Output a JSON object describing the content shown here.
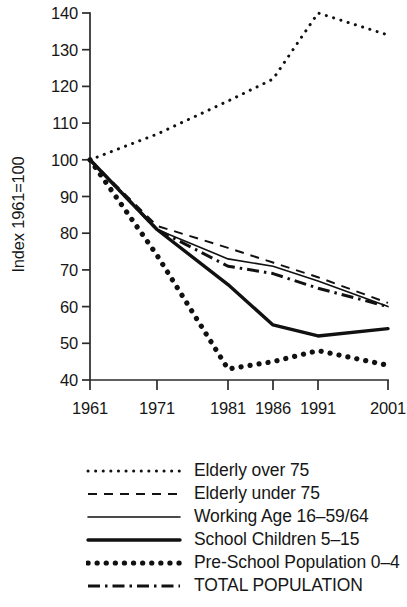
{
  "chart_data": {
    "type": "line",
    "title": "",
    "xlabel": "",
    "ylabel": "Index 1961=100",
    "x": [
      1961,
      1971,
      1981,
      1986,
      1991,
      2001
    ],
    "xtick_labels": [
      "1961",
      "1971",
      "1981",
      "1986",
      "1991",
      "2001"
    ],
    "ytick_labels": [
      "40",
      "50",
      "60",
      "70",
      "80",
      "90",
      "100",
      "110",
      "120",
      "130",
      "140"
    ],
    "ytick_values": [
      40,
      50,
      60,
      70,
      80,
      90,
      100,
      110,
      120,
      130,
      140
    ],
    "xlim": [
      1961,
      2001
    ],
    "ylim": [
      40,
      140
    ],
    "grid": false,
    "legend_position": "below",
    "series": [
      {
        "name": "Elderly over 75",
        "style": "fine-dotted",
        "values": [
          100,
          107,
          116,
          122,
          140,
          134
        ]
      },
      {
        "name": "Elderly under 75",
        "style": "dashed",
        "values": [
          100,
          82,
          76,
          72,
          68,
          61
        ]
      },
      {
        "name": "Working Age 16–59/64",
        "style": "thin-solid",
        "values": [
          100,
          81,
          73,
          71,
          67,
          60
        ]
      },
      {
        "name": "School Children 5–15",
        "style": "thick-solid",
        "values": [
          100,
          81,
          66,
          55,
          52,
          54
        ]
      },
      {
        "name": "Pre-School Population 0–4",
        "style": "large-dotted",
        "values": [
          100,
          74,
          43,
          45,
          48,
          44
        ]
      },
      {
        "name": "TOTAL POPULATION",
        "style": "dash-dot",
        "values": [
          100,
          81,
          71,
          69,
          65,
          60
        ]
      }
    ]
  },
  "legend": {
    "items": [
      {
        "label": "Elderly over 75",
        "style": "fine-dotted"
      },
      {
        "label": "Elderly under 75",
        "style": "dashed"
      },
      {
        "label": "Working Age 16–59/64",
        "style": "thin-solid"
      },
      {
        "label": "School Children 5–15",
        "style": "thick-solid"
      },
      {
        "label": "Pre-School Population 0–4",
        "style": "large-dotted"
      },
      {
        "label": "TOTAL POPULATION",
        "style": "dash-dot"
      }
    ]
  },
  "axes": {
    "y_axis_title": "Index 1961=100"
  }
}
